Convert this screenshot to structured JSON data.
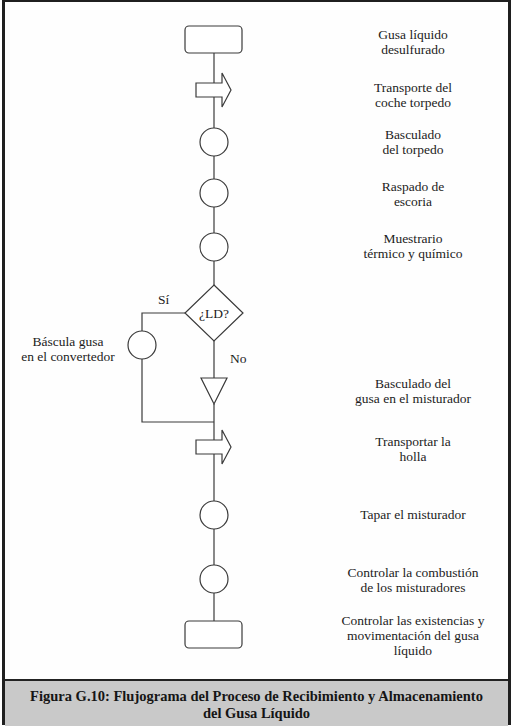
{
  "diagram": {
    "type": "process flowchart",
    "nodes": [
      {
        "id": "start",
        "shape": "terminal",
        "label": "Gusa líquido\ndesulfurado",
        "label_lines": [
          "Gusa líquido",
          "desulfurado"
        ]
      },
      {
        "id": "t1",
        "shape": "transport-arrow",
        "label_lines": [
          "Transporte del",
          "coche torpedo"
        ]
      },
      {
        "id": "o1",
        "shape": "operation-circle",
        "label_lines": [
          "Basculado",
          "del torpedo"
        ]
      },
      {
        "id": "o2",
        "shape": "operation-circle",
        "label_lines": [
          "Raspado de",
          "escoria"
        ]
      },
      {
        "id": "o3",
        "shape": "operation-circle",
        "label_lines": [
          "Muestrario",
          "térmico y químico"
        ]
      },
      {
        "id": "d1",
        "shape": "decision-diamond",
        "label": "¿LD?"
      },
      {
        "id": "o4",
        "shape": "operation-circle",
        "label_lines": [
          "Báscula gusa",
          "en el convertedor"
        ]
      },
      {
        "id": "s1",
        "shape": "storage-triangle",
        "label_lines": [
          "Basculado del",
          "gusa en el misturador"
        ]
      },
      {
        "id": "t2",
        "shape": "transport-arrow",
        "label_lines": [
          "Transportar la",
          "holla"
        ]
      },
      {
        "id": "o5",
        "shape": "operation-circle",
        "label_lines": [
          "Tapar el misturador"
        ]
      },
      {
        "id": "o6",
        "shape": "operation-circle",
        "label_lines": [
          "Controlar la combustión",
          "de los misturadores"
        ]
      },
      {
        "id": "end",
        "shape": "terminal",
        "label_lines": [
          "Controlar las existencias y",
          "movimentación del gusa",
          "líquido"
        ]
      }
    ],
    "edges": [
      {
        "from": "start",
        "to": "t1"
      },
      {
        "from": "t1",
        "to": "o1"
      },
      {
        "from": "o1",
        "to": "o2"
      },
      {
        "from": "o2",
        "to": "o3"
      },
      {
        "from": "o3",
        "to": "d1"
      },
      {
        "from": "d1",
        "to": "o4",
        "label": "Sí"
      },
      {
        "from": "d1",
        "to": "s1",
        "label": "No"
      },
      {
        "from": "o4",
        "to": "t2"
      },
      {
        "from": "s1",
        "to": "t2"
      },
      {
        "from": "t2",
        "to": "o5"
      },
      {
        "from": "o5",
        "to": "o6"
      },
      {
        "from": "o6",
        "to": "end"
      }
    ],
    "branch_labels": {
      "yes": "Sí",
      "no": "No"
    },
    "decision_text": "¿LD?"
  },
  "labels": {
    "start": [
      "Gusa líquido",
      "desulfurado"
    ],
    "t1": [
      "Transporte del",
      "coche torpedo"
    ],
    "o1": [
      "Basculado",
      "del torpedo"
    ],
    "o2": [
      "Raspado de",
      "escoria"
    ],
    "o3": [
      "Muestrario",
      "térmico y químico"
    ],
    "o4": [
      "Báscula gusa",
      "en el convertedor"
    ],
    "s1": [
      "Basculado del",
      "gusa en el misturador"
    ],
    "t2": [
      "Transportar la",
      "holla"
    ],
    "o5": [
      "Tapar el misturador"
    ],
    "o6": [
      "Controlar la combustión",
      "de los misturadores"
    ],
    "end": [
      "Controlar las existencias y",
      "movimentación del gusa",
      "líquido"
    ]
  },
  "caption": {
    "line1": "Figura G.10: Flujograma del Proceso de Recibimiento y Almacenamiento",
    "line2": "del Gusa Líquido"
  },
  "colors": {
    "stroke": "#3a3a3a",
    "caption_bg": "#c9c9c9",
    "border": "#1f1f1f"
  }
}
